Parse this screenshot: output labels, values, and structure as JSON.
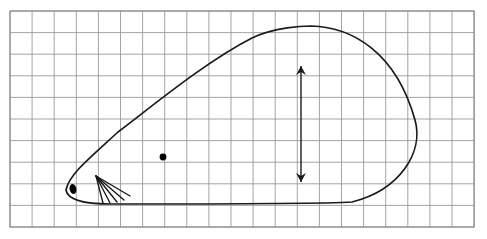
{
  "figure": {
    "title": "",
    "background_color": "#ffffff",
    "width": 487,
    "height": 239,
    "grid": {
      "name": "graph-paper-grid",
      "line_color": "#9a9a9a",
      "line_width": 0.9,
      "origin_x": 10,
      "origin_y": 11,
      "cell_width": 22.1,
      "cell_height": 21.6,
      "columns": 21,
      "rows": 10,
      "border_color": "#8a8a8a",
      "border_width": 1.1
    },
    "shape": {
      "name": "teardrop-outline",
      "description": "closed teardrop / wing cross-section outline with pointed left tail and rounded right bulb",
      "stroke_color": "#1a1a1a",
      "stroke_width": 1.7,
      "fill": "none",
      "tip_x": 66,
      "tip_y": 190,
      "apex_x": 311,
      "apex_y": 26,
      "right_extreme_x": 415,
      "right_extreme_y": 120,
      "bottom_y": 204
    },
    "eye_dot": {
      "name": "eye-marker",
      "cx": 73,
      "cy": 189,
      "rx": 3.4,
      "ry": 5.0,
      "rotation": -12,
      "color": "#000000"
    },
    "center_dot": {
      "name": "center-point-marker",
      "cx": 163,
      "cy": 157,
      "r": 3.4,
      "color": "#000000"
    },
    "rays": {
      "name": "ray-fan",
      "origin_x": 96,
      "origin_y": 176,
      "color": "#111111",
      "stroke_width": 1.3,
      "count": 5,
      "endpoints": [
        {
          "x": 103,
          "y": 203
        },
        {
          "x": 110,
          "y": 203
        },
        {
          "x": 117,
          "y": 202
        },
        {
          "x": 124,
          "y": 200
        },
        {
          "x": 130,
          "y": 196
        }
      ]
    },
    "arrow": {
      "name": "vertical-double-arrow",
      "x": 301,
      "y_top": 66,
      "y_bottom": 182,
      "color": "#1a1a1a",
      "stroke_width": 1.4,
      "head_length": 9,
      "head_width": 5,
      "label": ""
    }
  }
}
